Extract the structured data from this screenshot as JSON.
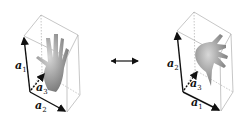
{
  "diagram": {
    "left_panel": {
      "axes": [
        {
          "name": "a",
          "sub": "1"
        },
        {
          "name": "a",
          "sub": "2"
        },
        {
          "name": "a",
          "sub": "3"
        }
      ]
    },
    "right_panel": {
      "axes": [
        {
          "name": "a",
          "sub": "2"
        },
        {
          "name": "a",
          "sub": "1"
        },
        {
          "name": "a",
          "sub": "3"
        }
      ]
    },
    "connector": "double-arrow-icon",
    "colors": {
      "lines": "#9a9a9a",
      "axes": "#111111",
      "hand": "#8c8c8c"
    }
  }
}
